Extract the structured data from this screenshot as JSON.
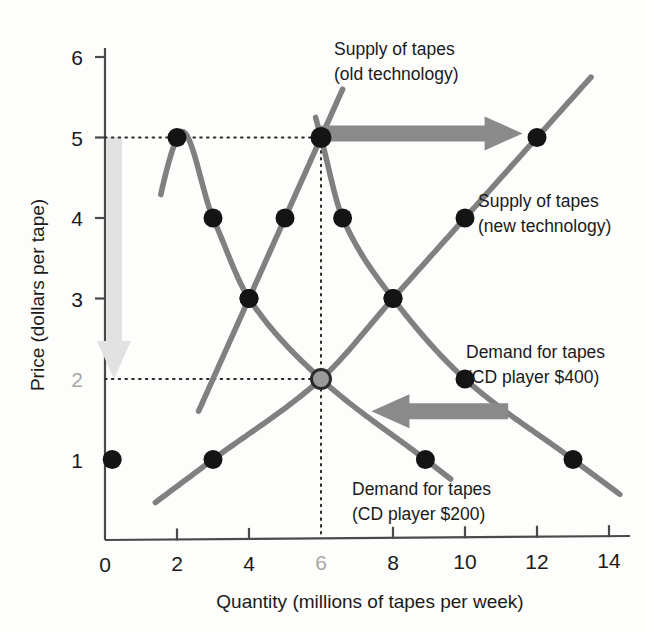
{
  "chart_data": {
    "type": "line",
    "title": "",
    "xlabel": "Quantity (millions of tapes per week)",
    "ylabel": "Price (dollars per tape)",
    "xlim": [
      0,
      15
    ],
    "ylim": [
      0,
      6.6
    ],
    "grid": false,
    "legend_position": "inline-annotations",
    "x_ticks": [
      {
        "value": 0,
        "label": "0",
        "muted": false,
        "tickmark": false
      },
      {
        "value": 2,
        "label": "2",
        "muted": false,
        "tickmark": true
      },
      {
        "value": 4,
        "label": "4",
        "muted": false,
        "tickmark": true
      },
      {
        "value": 6,
        "label": "6",
        "muted": true,
        "tickmark": false
      },
      {
        "value": 8,
        "label": "8",
        "muted": false,
        "tickmark": true
      },
      {
        "value": 10,
        "label": "10",
        "muted": false,
        "tickmark": true
      },
      {
        "value": 12,
        "label": "12",
        "muted": false,
        "tickmark": true
      },
      {
        "value": 14,
        "label": "14",
        "muted": false,
        "tickmark": true
      }
    ],
    "y_ticks": [
      {
        "value": 1,
        "label": "1",
        "muted": false,
        "tickmark": false
      },
      {
        "value": 2,
        "label": "2",
        "muted": true,
        "tickmark": false
      },
      {
        "value": 3,
        "label": "3",
        "muted": false,
        "tickmark": true
      },
      {
        "value": 4,
        "label": "4",
        "muted": false,
        "tickmark": true
      },
      {
        "value": 5,
        "label": "5",
        "muted": false,
        "tickmark": true
      },
      {
        "value": 6,
        "label": "6",
        "muted": false,
        "tickmark": true
      }
    ],
    "series": [
      {
        "name": "Supply of tapes (old technology)",
        "key": "supply_old",
        "curve_type": "supply",
        "color": "#808080",
        "points": [
          {
            "q": 4.0,
            "p": 3.0
          },
          {
            "q": 5.0,
            "p": 4.0
          },
          {
            "q": 6.0,
            "p": 5.0
          }
        ],
        "path_q_range": [
          2.6,
          6.6
        ]
      },
      {
        "name": "Supply of tapes (new technology)",
        "key": "supply_new",
        "curve_type": "supply",
        "color": "#808080",
        "points": [
          {
            "q": 3.0,
            "p": 1.0
          },
          {
            "q": 6.0,
            "p": 2.0
          },
          {
            "q": 8.0,
            "p": 3.0
          },
          {
            "q": 10.0,
            "p": 4.0
          },
          {
            "q": 12.0,
            "p": 5.0
          }
        ],
        "path_q_range": [
          1.4,
          13.5
        ]
      },
      {
        "name": "Demand for tapes (CD player $400)",
        "key": "demand_400",
        "curve_type": "demand",
        "color": "#808080",
        "points": [
          {
            "q": 6.0,
            "p": 5.0
          },
          {
            "q": 6.6,
            "p": 4.0
          },
          {
            "q": 8.0,
            "p": 3.0
          },
          {
            "q": 10.0,
            "p": 2.0
          },
          {
            "q": 13.0,
            "p": 1.0
          }
        ],
        "path_q_range": [
          5.85,
          14.3
        ]
      },
      {
        "name": "Demand for tapes (CD player $200)",
        "key": "demand_200",
        "curve_type": "demand",
        "color": "#808080",
        "points": [
          {
            "q": 0.2,
            "p": 1.0
          },
          {
            "q": 2.0,
            "p": 5.0
          },
          {
            "q": 3.0,
            "p": 4.0
          },
          {
            "q": 4.0,
            "p": 3.0
          },
          {
            "q": 6.0,
            "p": 2.0
          },
          {
            "q": 8.9,
            "p": 1.0
          }
        ],
        "path_q_range": [
          1.55,
          9.6
        ]
      }
    ],
    "equilibria": [
      {
        "name": "old-equilibrium",
        "q": 6.0,
        "p": 5.0,
        "style": "filled"
      },
      {
        "name": "new-equilibrium",
        "q": 6.0,
        "p": 2.0,
        "style": "hollow-gray"
      }
    ],
    "reference_lines": [
      {
        "name": "price-5-dotted",
        "orientation": "horizontal",
        "value": 5
      },
      {
        "name": "price-2-dotted",
        "orientation": "horizontal",
        "value": 2
      },
      {
        "name": "quantity-6-dotted",
        "orientation": "vertical",
        "value": 6
      }
    ],
    "annotations": [
      {
        "name": "supply-shift-arrow",
        "direction": "right",
        "color": "#8a8a8a",
        "from": {
          "q": 6.0,
          "p": 5.05
        },
        "to": {
          "q": 11.6,
          "p": 5.05
        }
      },
      {
        "name": "demand-shift-arrow",
        "direction": "left",
        "color": "#8a8a8a",
        "from": {
          "q": 11.2,
          "p": 1.6
        },
        "to": {
          "q": 7.4,
          "p": 1.6
        }
      },
      {
        "name": "price-fall-arrow",
        "direction": "down",
        "color": "#e2e2e2",
        "from": {
          "q": 0.25,
          "p": 5.0
        },
        "to": {
          "q": 0.25,
          "p": 2.0
        }
      }
    ]
  },
  "labels": {
    "supply_old_line1": "Supply of tapes",
    "supply_old_line2": "(old technology)",
    "supply_new_line1": "Supply of tapes",
    "supply_new_line2": "(new technology)",
    "demand_400_line1": "Demand for tapes",
    "demand_400_line2": "(CD player $400)",
    "demand_200_line1": "Demand for tapes",
    "demand_200_line2": "(CD player $200)"
  },
  "axes": {
    "x_title": "Quantity (millions of tapes per week)",
    "y_title": "Price (dollars per tape)"
  },
  "colors": {
    "curve": "#808080",
    "point": "#141414",
    "arrow_dark": "#8a8a8a",
    "arrow_light": "#e2e2e2",
    "axis": "#4a4a4a",
    "text": "#1a1a1a",
    "muted_text": "#a8a8a8",
    "background": "#fdfdfb"
  }
}
